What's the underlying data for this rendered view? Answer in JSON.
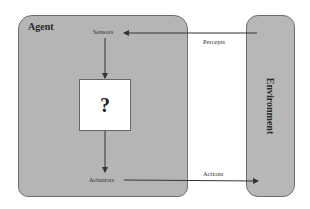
{
  "diagram": {
    "agent": {
      "label": "Agent"
    },
    "environment": {
      "label": "Environment"
    },
    "agent_program": {
      "label": "?"
    },
    "sensors": {
      "label": "Sensors"
    },
    "actuators": {
      "label": "Actuators"
    },
    "percepts": {
      "label": "Percepts"
    },
    "actions": {
      "label": "Actions"
    },
    "colors": {
      "box_fill": "#b5b5b5",
      "box_border": "#6e6e6e",
      "program_fill": "#ffffff",
      "arrow": "#333333"
    }
  }
}
